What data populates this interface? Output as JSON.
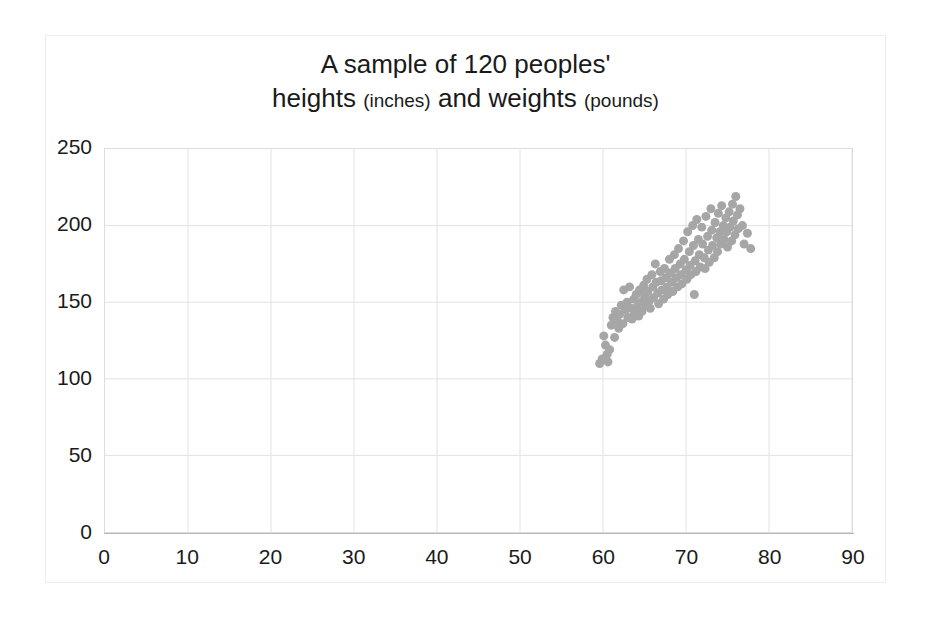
{
  "chart_data": {
    "type": "scatter",
    "title": "A sample of 120 peoples' heights (inches) and weights (pounds)",
    "title_line1": "A sample of 120 peoples'",
    "title_line2_a": "heights",
    "title_line2_b": "(inches)",
    "title_line2_c": "and weights",
    "title_line2_d": "(pounds)",
    "xlabel": "",
    "ylabel": "",
    "xlim": [
      0,
      90
    ],
    "ylim": [
      0,
      250
    ],
    "xticks": [
      0,
      10,
      20,
      30,
      40,
      50,
      60,
      70,
      80,
      90
    ],
    "yticks": [
      0,
      50,
      100,
      150,
      200,
      250
    ],
    "grid": true,
    "legend": "none",
    "marker_color": "#a6a6a6",
    "marker_size": 9,
    "n_points": 120,
    "x_name": "height_inches",
    "y_name": "weight_pounds",
    "points": [
      [
        59.6,
        110
      ],
      [
        59.9,
        113
      ],
      [
        60.1,
        128
      ],
      [
        60.3,
        122
      ],
      [
        60.5,
        116
      ],
      [
        60.6,
        111
      ],
      [
        60.8,
        119
      ],
      [
        61.0,
        135
      ],
      [
        61.2,
        140
      ],
      [
        61.4,
        127
      ],
      [
        61.5,
        144
      ],
      [
        61.7,
        138
      ],
      [
        61.9,
        133
      ],
      [
        62.0,
        142
      ],
      [
        62.2,
        148
      ],
      [
        62.4,
        136
      ],
      [
        62.5,
        158
      ],
      [
        62.7,
        145
      ],
      [
        62.9,
        150
      ],
      [
        63.0,
        140
      ],
      [
        63.2,
        160
      ],
      [
        63.4,
        146
      ],
      [
        63.5,
        139
      ],
      [
        63.7,
        152
      ],
      [
        63.8,
        143
      ],
      [
        64.0,
        155
      ],
      [
        64.1,
        147
      ],
      [
        64.3,
        141
      ],
      [
        64.4,
        158
      ],
      [
        64.6,
        150
      ],
      [
        64.7,
        144
      ],
      [
        64.9,
        161
      ],
      [
        65.0,
        154
      ],
      [
        65.2,
        148
      ],
      [
        65.3,
        165
      ],
      [
        65.4,
        157
      ],
      [
        65.6,
        151
      ],
      [
        65.7,
        146
      ],
      [
        65.9,
        168
      ],
      [
        66.0,
        160
      ],
      [
        66.1,
        153
      ],
      [
        66.3,
        175
      ],
      [
        66.4,
        163
      ],
      [
        66.6,
        156
      ],
      [
        66.7,
        149
      ],
      [
        66.9,
        170
      ],
      [
        67.0,
        164
      ],
      [
        67.1,
        158
      ],
      [
        67.3,
        152
      ],
      [
        67.4,
        172
      ],
      [
        67.6,
        166
      ],
      [
        67.7,
        160
      ],
      [
        67.8,
        155
      ],
      [
        68.0,
        178
      ],
      [
        68.1,
        169
      ],
      [
        68.3,
        163
      ],
      [
        68.4,
        157
      ],
      [
        68.6,
        181
      ],
      [
        68.7,
        172
      ],
      [
        68.8,
        166
      ],
      [
        69.0,
        160
      ],
      [
        69.1,
        185
      ],
      [
        69.3,
        175
      ],
      [
        69.4,
        168
      ],
      [
        69.5,
        162
      ],
      [
        69.7,
        190
      ],
      [
        69.8,
        178
      ],
      [
        70.0,
        171
      ],
      [
        70.1,
        165
      ],
      [
        70.2,
        196
      ],
      [
        70.4,
        183
      ],
      [
        70.5,
        174
      ],
      [
        70.6,
        168
      ],
      [
        70.8,
        200
      ],
      [
        70.9,
        187
      ],
      [
        71.1,
        177
      ],
      [
        71.2,
        170
      ],
      [
        71.3,
        204
      ],
      [
        71.5,
        191
      ],
      [
        71.6,
        181
      ],
      [
        71.7,
        173
      ],
      [
        71.9,
        199
      ],
      [
        72.0,
        188
      ],
      [
        72.2,
        179
      ],
      [
        72.3,
        172
      ],
      [
        72.4,
        206
      ],
      [
        72.6,
        193
      ],
      [
        72.7,
        184
      ],
      [
        72.8,
        176
      ],
      [
        73.0,
        211
      ],
      [
        73.1,
        197
      ],
      [
        73.2,
        187
      ],
      [
        73.4,
        179
      ],
      [
        73.5,
        202
      ],
      [
        73.7,
        192
      ],
      [
        73.8,
        183
      ],
      [
        73.9,
        208
      ],
      [
        74.1,
        196
      ],
      [
        74.2,
        188
      ],
      [
        74.3,
        213
      ],
      [
        74.5,
        200
      ],
      [
        74.6,
        191
      ],
      [
        74.8,
        205
      ],
      [
        74.9,
        196
      ],
      [
        75.0,
        186
      ],
      [
        75.2,
        209
      ],
      [
        75.3,
        199
      ],
      [
        75.5,
        190
      ],
      [
        75.6,
        214
      ],
      [
        75.7,
        203
      ],
      [
        75.9,
        194
      ],
      [
        76.0,
        219
      ],
      [
        76.2,
        207
      ],
      [
        76.3,
        198
      ],
      [
        76.5,
        211
      ],
      [
        76.8,
        200
      ],
      [
        77.0,
        188
      ],
      [
        77.4,
        195
      ],
      [
        77.8,
        185
      ],
      [
        71.0,
        155
      ]
    ]
  },
  "axes": {
    "y_tick_labels": [
      "250",
      "200",
      "150",
      "100",
      "50",
      "0"
    ],
    "x_tick_labels": [
      "0",
      "10",
      "20",
      "30",
      "40",
      "50",
      "60",
      "70",
      "80",
      "90"
    ]
  }
}
